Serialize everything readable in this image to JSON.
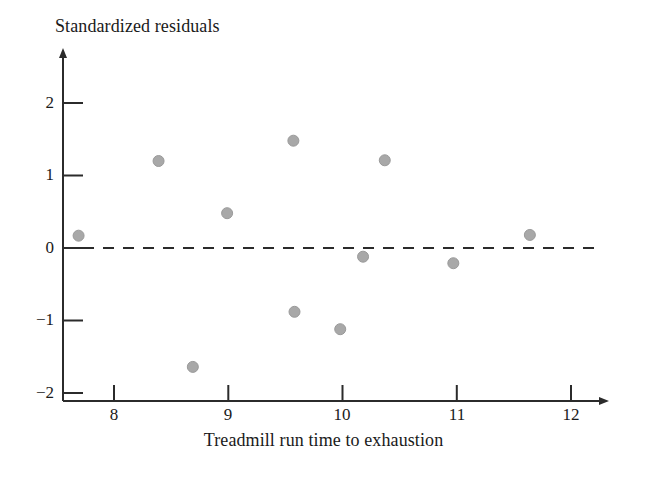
{
  "chart_data": {
    "type": "scatter",
    "title": "",
    "xlabel": "Treadmill run time to exhaustion",
    "ylabel": "Standardized residuals",
    "xlim": [
      7.45,
      12.35
    ],
    "ylim": [
      -2.15,
      2.45
    ],
    "xticks": [
      8,
      9,
      10,
      11,
      12
    ],
    "xtick_labels": [
      "8",
      "9",
      "10",
      "11",
      "12"
    ],
    "yticks": [
      2,
      1,
      0,
      -1,
      -2
    ],
    "ytick_labels": [
      "2",
      "1",
      "0",
      "−1",
      "−2"
    ],
    "grid": false,
    "legend": null,
    "reference_line": {
      "axis": "y",
      "value": 0,
      "style": "dashed",
      "color": "#2b2b2b"
    },
    "marker": {
      "shape": "circle",
      "color": "#a8a8a8",
      "edge_color": "#9a9a9a",
      "size": 11
    },
    "points": [
      {
        "x": 7.69,
        "y": 0.17
      },
      {
        "x": 8.39,
        "y": 1.2
      },
      {
        "x": 8.69,
        "y": -1.64
      },
      {
        "x": 8.99,
        "y": 0.48
      },
      {
        "x": 9.57,
        "y": 1.48
      },
      {
        "x": 9.58,
        "y": -0.88
      },
      {
        "x": 9.98,
        "y": -1.12
      },
      {
        "x": 10.18,
        "y": -0.12
      },
      {
        "x": 10.37,
        "y": 1.21
      },
      {
        "x": 10.97,
        "y": -0.21
      },
      {
        "x": 11.64,
        "y": 0.18
      }
    ]
  },
  "axes": {
    "x_axis_title": "Treadmill run time to exhaustion",
    "y_axis_title": "Standardized residuals",
    "x_tick_labels": [
      "8",
      "9",
      "10",
      "11",
      "12"
    ],
    "y_tick_labels": [
      "2",
      "1",
      "0",
      "−1",
      "−2"
    ]
  },
  "style": {
    "axis_color": "#2b2b2b",
    "marker_color": "#a8a8a8",
    "background": "#ffffff",
    "text_color": "#1a1a1a"
  }
}
